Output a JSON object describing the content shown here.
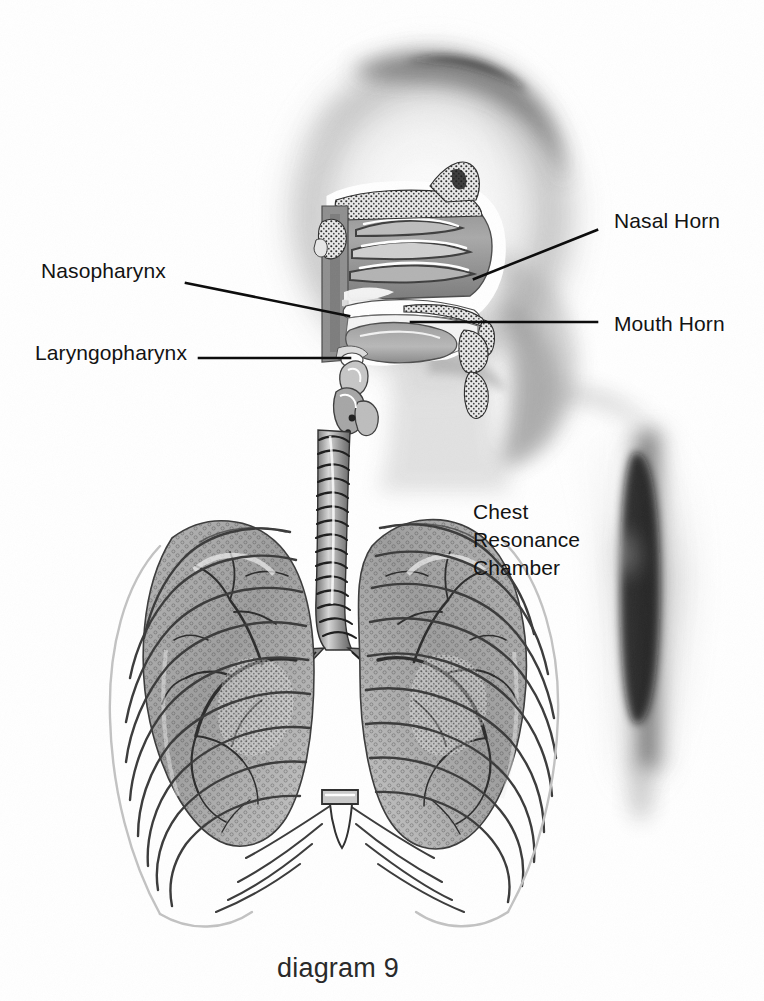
{
  "figure": {
    "caption": "diagram 9",
    "caption_x": 277,
    "caption_y": 952,
    "background_color": "#ffffff",
    "ink_color": "#131313",
    "width": 764,
    "height": 1001
  },
  "labels": [
    {
      "id": "nasopharynx",
      "text": "Nasopharynx",
      "x": 41,
      "y": 257,
      "align": "left",
      "leader": {
        "x1": 186,
        "y1": 283,
        "x2": 349,
        "y2": 316
      }
    },
    {
      "id": "laryngopharynx",
      "text": "Laryngopharynx",
      "x": 35,
      "y": 339,
      "align": "left",
      "leader": {
        "x1": 199,
        "y1": 358,
        "x2": 350,
        "y2": 358
      }
    },
    {
      "id": "nasal-horn",
      "text": "Nasal Horn",
      "x": 614,
      "y": 207,
      "align": "left",
      "leader": {
        "x1": 597,
        "y1": 230,
        "x2": 474,
        "y2": 279
      }
    },
    {
      "id": "mouth-horn",
      "text": "Mouth Horn",
      "x": 614,
      "y": 310,
      "align": "left",
      "leader": {
        "x1": 597,
        "y1": 322,
        "x2": 411,
        "y2": 322
      }
    }
  ],
  "text_blocks": [
    {
      "id": "chest-resonance-chamber",
      "lines": [
        "Chest",
        "Resonance",
        "Chamber"
      ],
      "x": 473,
      "y": 498,
      "leader": null
    }
  ],
  "anatomy_parts": [
    "ghosted head silhouette",
    "nasal cavity with turbinates",
    "hard palate",
    "tongue",
    "soft palate and uvula",
    "nasopharynx",
    "oropharynx",
    "laryngopharynx",
    "epiglottis",
    "larynx",
    "trachea with cartilage rings",
    "left lung",
    "right lung",
    "bronchial tree",
    "rib cage",
    "sternum",
    "xiphoid process",
    "costal arch",
    "ghosted arm and shoulder shadow"
  ]
}
